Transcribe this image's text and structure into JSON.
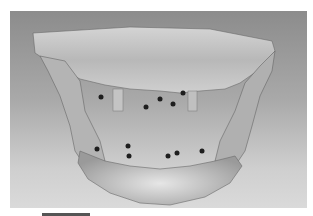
{
  "figure": {
    "background_gradient": [
      "#8c8c8c",
      "#dadada"
    ],
    "bone_color": "#c8c8c8",
    "marker_color": "#1e1e1e",
    "markers": [
      {
        "x": 91,
        "y": 86
      },
      {
        "x": 136,
        "y": 96
      },
      {
        "x": 150,
        "y": 88
      },
      {
        "x": 163,
        "y": 93
      },
      {
        "x": 173,
        "y": 82
      },
      {
        "x": 87,
        "y": 138
      },
      {
        "x": 118,
        "y": 135
      },
      {
        "x": 119,
        "y": 145
      },
      {
        "x": 158,
        "y": 145
      },
      {
        "x": 167,
        "y": 142
      },
      {
        "x": 192,
        "y": 140
      }
    ]
  },
  "scale_bar": {
    "visible": true
  }
}
